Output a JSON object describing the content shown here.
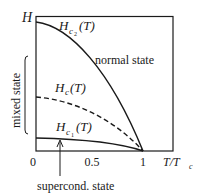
{
  "diagram": {
    "type": "phase-diagram",
    "y_axis_label": "H",
    "x_axis_label": "T/T",
    "x_axis_label_sub": "c",
    "x_ticks": [
      "0",
      "0.5",
      "1"
    ],
    "curves": [
      {
        "name": "Hc2",
        "label_main": "H",
        "label_sub": "c",
        "label_subsub": "2",
        "label_arg": "(T)",
        "style": "solid"
      },
      {
        "name": "Hc",
        "label_main": "H",
        "label_sub": "c",
        "label_arg": "(T)",
        "style": "dashed"
      },
      {
        "name": "Hc1",
        "label_main": "H",
        "label_sub": "c",
        "label_subsub": "1",
        "label_arg": "(T)",
        "style": "solid"
      }
    ],
    "regions": {
      "normal": "normal state",
      "mixed": "mixed state",
      "superconducting": "supercond. state"
    },
    "colors": {
      "ink": "#1a1a1a",
      "background": "#ffffff"
    }
  }
}
